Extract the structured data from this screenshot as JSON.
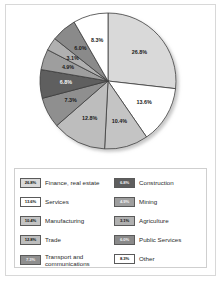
{
  "chart_data": {
    "type": "pie",
    "title": "",
    "subtitle": "",
    "xlabel": "",
    "ylabel": "",
    "legend_position": "bottom",
    "grid": false,
    "start_angle_deg": 0,
    "direction": "clockwise",
    "categories": [
      "Finance, real estate",
      "Services",
      "Manufacturing",
      "Trade",
      "Transport and\ncommunications",
      "Construction",
      "Mining",
      "Agriculture",
      "Public Services",
      "Other"
    ],
    "values": [
      26.8,
      13.6,
      10.4,
      12.8,
      7.3,
      6.8,
      4.9,
      3.1,
      6.0,
      8.3
    ],
    "labels": [
      "26.8%",
      "13.6%",
      "10.4%",
      "12.8%",
      "7.3%",
      "6.8%",
      "4.9%",
      "3.1%",
      "6.0%",
      "8.3%"
    ],
    "colors": [
      "#d9d9d9",
      "#ffffff",
      "#c4c4c4",
      "#bdbdbd",
      "#8f8f8f",
      "#5e5e5e",
      "#9e9e9e",
      "#b0b0b0",
      "#8a8a8a",
      "#ffffff"
    ],
    "label_is_dark_bg": [
      false,
      false,
      false,
      false,
      false,
      true,
      false,
      false,
      false,
      false
    ]
  },
  "legend": {
    "left_column": [
      {
        "value": "26.8%",
        "label": "Finance, real estate",
        "color": "#d9d9d9",
        "dark": false
      },
      {
        "value": "13.6%",
        "label": "Services",
        "color": "#ffffff",
        "dark": false
      },
      {
        "value": "10.4%",
        "label": "Manufacturing",
        "color": "#c4c4c4",
        "dark": false
      },
      {
        "value": "12.8%",
        "label": "Trade",
        "color": "#bdbdbd",
        "dark": false
      },
      {
        "value": "7.3%",
        "label": "Transport and\ncommunications",
        "color": "#8f8f8f",
        "dark": true
      }
    ],
    "right_column": [
      {
        "value": "6.8%",
        "label": "Construction",
        "color": "#5e5e5e",
        "dark": true
      },
      {
        "value": "4.9%",
        "label": "Mining",
        "color": "#9e9e9e",
        "dark": true
      },
      {
        "value": "3.1%",
        "label": "Agriculture",
        "color": "#b0b0b0",
        "dark": false
      },
      {
        "value": "6.0%",
        "label": "Public Services",
        "color": "#8a8a8a",
        "dark": true
      },
      {
        "value": "8.3%",
        "label": "Other",
        "color": "#ffffff",
        "dark": false
      }
    ]
  }
}
